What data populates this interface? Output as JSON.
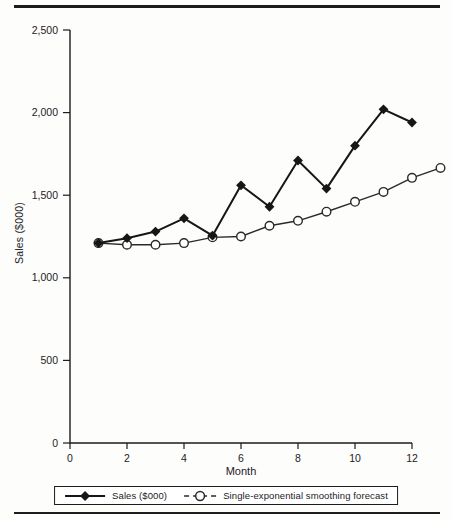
{
  "chart_data": {
    "type": "line",
    "title": "",
    "xlabel": "Month",
    "ylabel": "Sales ($000)",
    "xlim": [
      0,
      13.4
    ],
    "ylim": [
      0,
      2500
    ],
    "x_ticks": [
      "0",
      "2",
      "4",
      "6",
      "8",
      "10",
      "12"
    ],
    "x_tick_values": [
      0,
      2,
      4,
      6,
      8,
      10,
      12
    ],
    "y_tick_labels": [
      "0",
      "500",
      "1,000",
      "1,500",
      "2,000",
      "2,500"
    ],
    "y_tick_values": [
      0,
      500,
      1000,
      1500,
      2000,
      2500
    ],
    "grid": "off",
    "legend_position": "bottom",
    "axis_color": "#1c1c1c",
    "series": [
      {
        "name": "Sales ($000)",
        "marker": "filled-diamond",
        "line_style": "solid",
        "color": "#161616",
        "x": [
          1,
          2,
          3,
          4,
          5,
          6,
          7,
          8,
          9,
          10,
          11,
          12
        ],
        "values": [
          1210,
          1240,
          1280,
          1360,
          1255,
          1560,
          1430,
          1710,
          1540,
          1800,
          2020,
          1940
        ]
      },
      {
        "name": "Single-exponential smoothing forecast",
        "marker": "open-circle",
        "line_style": "solid",
        "legend_line_style": "dashed",
        "color": "#2a2a2a",
        "x": [
          1,
          2,
          3,
          4,
          5,
          6,
          7,
          8,
          9,
          10,
          11,
          12,
          13
        ],
        "values": [
          1210,
          1200,
          1200,
          1210,
          1245,
          1250,
          1315,
          1345,
          1400,
          1460,
          1520,
          1605,
          1665
        ]
      }
    ]
  }
}
